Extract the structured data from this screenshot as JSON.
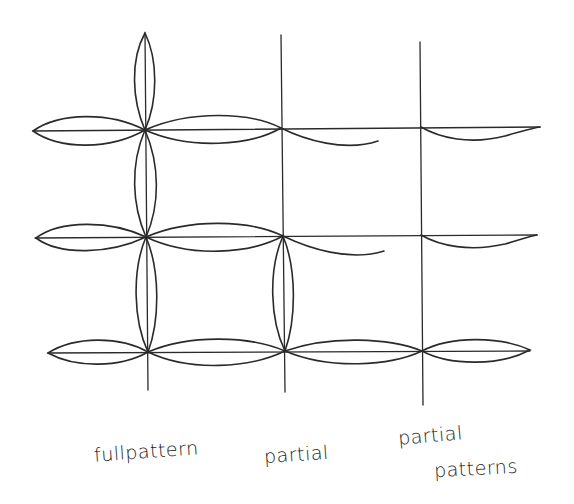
{
  "diagram": {
    "title": "",
    "stroke_color": "#2a2a2a",
    "background": "#ffffff",
    "grid": {
      "vertical_lines_x": [
        146,
        283,
        422
      ],
      "horizontal_lines_y": [
        130,
        237,
        352
      ]
    },
    "labels": [
      {
        "id": "full",
        "text": "fullpattern"
      },
      {
        "id": "partial",
        "text": "partial"
      },
      {
        "id": "partial2_line1",
        "text": "partial"
      },
      {
        "id": "partial2_line2",
        "text": "patterns"
      }
    ]
  }
}
